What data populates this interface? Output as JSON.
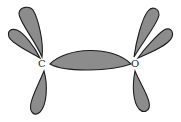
{
  "diagram": {
    "atoms": [
      {
        "label": "C",
        "x": 42,
        "y": 66
      },
      {
        "label": "O",
        "x": 135,
        "y": 66
      }
    ],
    "colors": {
      "lobe_fill": "#8c8c8c",
      "lobe_stroke": "#1e1e1e",
      "background": "#ffffff"
    }
  }
}
